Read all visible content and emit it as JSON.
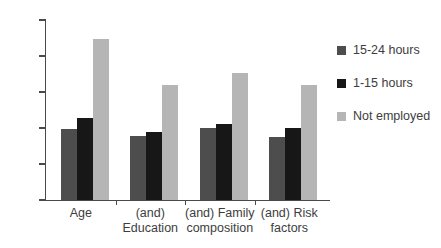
{
  "chart_data": {
    "type": "bar",
    "title": "",
    "subtitle": "",
    "xlabel": "",
    "ylabel": "",
    "grid": false,
    "legend_position": "right",
    "ylim": [
      0,
      2.5
    ],
    "ytick_labels": [
      "0",
      "0.5",
      "1",
      "1.5",
      "2",
      "2.5"
    ],
    "ytick_values": [
      0,
      0.5,
      1,
      1.5,
      2,
      2.5
    ],
    "categories": [
      "Age",
      "(and)\nEducation",
      "(and) Family\ncomposition",
      "(and) Risk\nfactors"
    ],
    "series": [
      {
        "name": "15-24 hours",
        "color": "#4d4d4d",
        "values": [
          0.99,
          0.89,
          1.0,
          0.88
        ]
      },
      {
        "name": "1-15 hours",
        "color": "#171717",
        "values": [
          1.14,
          0.94,
          1.05,
          1.0
        ]
      },
      {
        "name": "Not employed",
        "color": "#b5b5b5",
        "values": [
          2.23,
          1.6,
          1.76,
          1.6
        ]
      }
    ]
  }
}
